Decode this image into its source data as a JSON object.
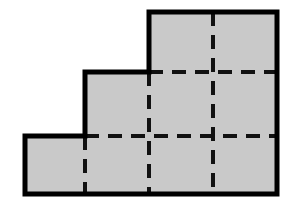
{
  "figure": {
    "title": "Staircase polygon composed of unit squares",
    "type": "geometric-diagram",
    "canvas": {
      "width": 297,
      "height": 211
    },
    "style": {
      "background_color": "#ffffff",
      "fill_color": "#c9c9c9",
      "outline_color": "#000000",
      "outline_width": 5,
      "grid_line_color": "#111111",
      "grid_line_width": 4,
      "grid_dash_pattern": "14 9"
    },
    "grid": {
      "unit_size_x": 64,
      "unit_size_y": 60.5,
      "columns": 4,
      "rows": 3,
      "x_lines": [
        25,
        85,
        149,
        213,
        277
      ],
      "y_lines": [
        12,
        72,
        136,
        194
      ],
      "square_count": 6
    },
    "outline_points": [
      {
        "x": 25,
        "y": 136
      },
      {
        "x": 85,
        "y": 136
      },
      {
        "x": 85,
        "y": 72
      },
      {
        "x": 149,
        "y": 72
      },
      {
        "x": 149,
        "y": 12
      },
      {
        "x": 277,
        "y": 12
      },
      {
        "x": 277,
        "y": 194
      },
      {
        "x": 25,
        "y": 194
      }
    ],
    "outline_path": "M25,136 L85,136 L85,72 L149,72 L149,12 L277,12 L277,194 L25,194 Z",
    "interior_dashed_segments": [
      {
        "name": "vertical-divider-x85",
        "x1": 85,
        "y1": 136,
        "x2": 85,
        "y2": 194
      },
      {
        "name": "vertical-divider-x149",
        "x1": 149,
        "y1": 72,
        "x2": 149,
        "y2": 194
      },
      {
        "name": "vertical-divider-x213",
        "x1": 213,
        "y1": 12,
        "x2": 213,
        "y2": 194
      },
      {
        "name": "horizontal-divider-y72",
        "x1": 149,
        "y1": 72,
        "x2": 277,
        "y2": 72
      },
      {
        "name": "horizontal-divider-y136",
        "x1": 85,
        "y1": 136,
        "x2": 277,
        "y2": 136
      }
    ],
    "cells": [
      {
        "name": "cell-col1-row3",
        "x": 25,
        "y": 136,
        "w": 60,
        "h": 58
      },
      {
        "name": "cell-col2-row3",
        "x": 85,
        "y": 136,
        "w": 64,
        "h": 58
      },
      {
        "name": "cell-col3-row3",
        "x": 149,
        "y": 136,
        "w": 64,
        "h": 58
      },
      {
        "name": "cell-col4-row3",
        "x": 213,
        "y": 136,
        "w": 64,
        "h": 58
      },
      {
        "name": "cell-col3-row2",
        "x": 149,
        "y": 72,
        "w": 64,
        "h": 64
      },
      {
        "name": "cell-col4-row2",
        "x": 213,
        "y": 72,
        "w": 64,
        "h": 64
      },
      {
        "name": "cell-col3-row1",
        "x": 149,
        "y": 12,
        "w": 64,
        "h": 60
      },
      {
        "name": "cell-col4-row1",
        "x": 213,
        "y": 12,
        "w": 64,
        "h": 60
      }
    ],
    "labels": []
  }
}
